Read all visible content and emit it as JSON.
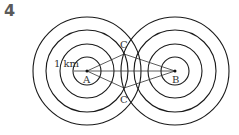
{
  "problem_number": "4",
  "labels": {
    "A": "A",
    "B": "B",
    "C_top": "C",
    "C_bottom": "C",
    "scale": "1 km"
  },
  "geometry": {
    "A": [
      87,
      71
    ],
    "B": [
      175,
      71
    ],
    "radii": [
      14,
      27,
      41,
      54
    ],
    "C_top": [
      124,
      54
    ],
    "C_bottom": [
      124,
      88
    ]
  },
  "colors": {
    "stroke": "#1a1a1a",
    "text": "#333333"
  }
}
